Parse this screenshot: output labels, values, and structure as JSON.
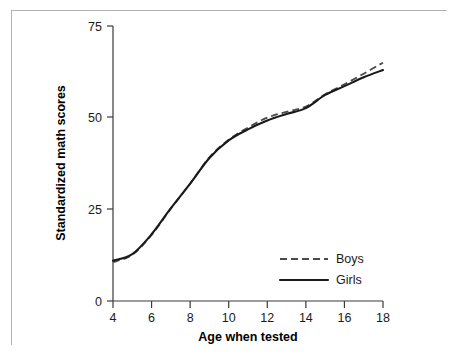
{
  "chart_data": {
    "type": "line",
    "title": "",
    "xlabel": "Age when tested",
    "ylabel": "Standardized math scores",
    "xlim": [
      4,
      18
    ],
    "ylim": [
      0,
      75
    ],
    "xticks": [
      4,
      6,
      8,
      10,
      12,
      14,
      16,
      18
    ],
    "yticks": [
      0,
      25,
      50,
      75
    ],
    "xtick_labels": [
      "4",
      "6",
      "8",
      "10",
      "12",
      "14",
      "16",
      "18"
    ],
    "ytick_labels": [
      "0",
      "25",
      "50",
      "75"
    ],
    "grid": false,
    "legend_position": "lower-right-inside",
    "x": [
      4,
      5,
      6,
      7,
      8,
      9,
      10,
      11,
      12,
      13,
      14,
      15,
      16,
      17,
      18
    ],
    "series": [
      {
        "name": "Boys",
        "style": "dashed",
        "color": "#4a4a4a",
        "values": [
          10.6,
          12.6,
          18.0,
          25.2,
          32.0,
          39.2,
          44.0,
          47.3,
          50.0,
          51.6,
          53.0,
          56.4,
          59.1,
          62.0,
          65.0
        ]
      },
      {
        "name": "Girls",
        "style": "solid",
        "color": "#1a1a1a",
        "values": [
          11.0,
          12.8,
          18.2,
          25.3,
          32.0,
          39.0,
          43.8,
          46.8,
          49.2,
          51.0,
          52.6,
          56.2,
          58.6,
          61.0,
          63.0
        ]
      }
    ]
  },
  "legend": {
    "entries": [
      {
        "label": "Boys",
        "style": "dashed"
      },
      {
        "label": "Girls",
        "style": "solid"
      }
    ]
  },
  "axes": {
    "x_title": "Age when tested",
    "y_title": "Standardized math scores"
  }
}
